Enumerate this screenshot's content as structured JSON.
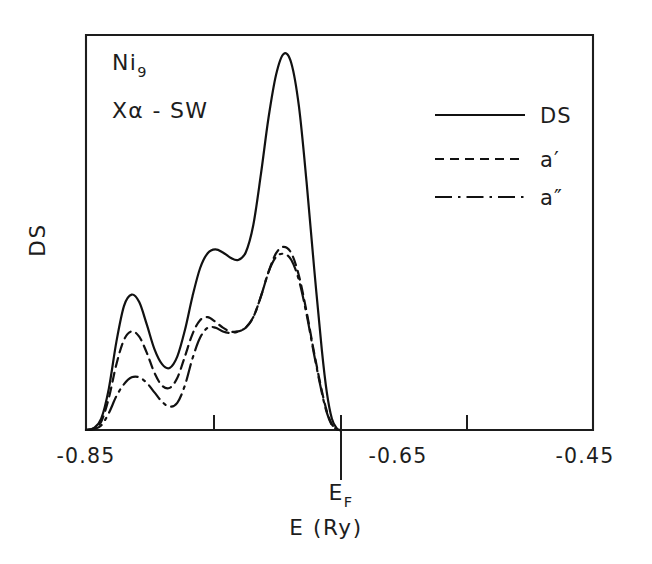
{
  "figure": {
    "annotations": {
      "system": "Ni",
      "system_subscript": "9",
      "method": "Xα - SW"
    },
    "fermi_marker": {
      "label": "E",
      "label_subscript": "F",
      "value": -0.65
    }
  },
  "legend": {
    "position": "top-right",
    "entries": [
      {
        "label": "DS",
        "style": "solid"
      },
      {
        "label": "a′",
        "style": "dashed"
      },
      {
        "label": "a″",
        "style": "dashdot"
      }
    ]
  },
  "chart_data": {
    "type": "line",
    "title": "",
    "subtitle": "",
    "xlabel": "E (Ry)",
    "ylabel": "DS",
    "xlim": [
      -0.85,
      -0.45
    ],
    "ylim": [
      0,
      1.05
    ],
    "grid": false,
    "xticks": [
      -0.85,
      -0.75,
      -0.65,
      -0.55,
      -0.45
    ],
    "xtick_labels": [
      "-0.85",
      "",
      "-0.65",
      "",
      "-0.45"
    ],
    "yticks": [],
    "ytick_labels": [],
    "annotations": [
      {
        "text": "Ni9",
        "x": -0.825,
        "y": 0.93
      },
      {
        "text": "Xα - SW",
        "x": -0.825,
        "y": 0.8
      },
      {
        "text": "EF",
        "x": -0.65,
        "y": -0.16
      }
    ],
    "series": [
      {
        "name": "DS",
        "style": "solid",
        "x": [
          -0.85,
          -0.844,
          -0.838,
          -0.832,
          -0.826,
          -0.82,
          -0.814,
          -0.808,
          -0.802,
          -0.796,
          -0.79,
          -0.784,
          -0.778,
          -0.772,
          -0.766,
          -0.76,
          -0.754,
          -0.748,
          -0.742,
          -0.736,
          -0.73,
          -0.724,
          -0.718,
          -0.712,
          -0.706,
          -0.7,
          -0.694,
          -0.688,
          -0.682,
          -0.676,
          -0.67,
          -0.664,
          -0.66,
          -0.656,
          -0.652,
          -0.65
        ],
        "y": [
          0.0,
          0.005,
          0.03,
          0.11,
          0.235,
          0.33,
          0.36,
          0.34,
          0.28,
          0.215,
          0.175,
          0.165,
          0.195,
          0.265,
          0.355,
          0.43,
          0.47,
          0.48,
          0.472,
          0.458,
          0.452,
          0.472,
          0.545,
          0.68,
          0.83,
          0.945,
          1.0,
          0.975,
          0.86,
          0.66,
          0.43,
          0.215,
          0.1,
          0.03,
          0.004,
          0.0
        ]
      },
      {
        "name": "a′",
        "style": "dashed",
        "x": [
          -0.85,
          -0.844,
          -0.838,
          -0.832,
          -0.826,
          -0.82,
          -0.814,
          -0.808,
          -0.802,
          -0.796,
          -0.79,
          -0.784,
          -0.778,
          -0.772,
          -0.766,
          -0.76,
          -0.754,
          -0.748,
          -0.742,
          -0.736,
          -0.73,
          -0.724,
          -0.718,
          -0.712,
          -0.706,
          -0.7,
          -0.694,
          -0.688,
          -0.682,
          -0.676,
          -0.67,
          -0.664,
          -0.66,
          -0.656,
          -0.652,
          -0.65
        ],
        "y": [
          0.0,
          0.004,
          0.022,
          0.085,
          0.175,
          0.24,
          0.262,
          0.248,
          0.205,
          0.152,
          0.118,
          0.112,
          0.138,
          0.195,
          0.255,
          0.292,
          0.3,
          0.288,
          0.272,
          0.262,
          0.262,
          0.272,
          0.3,
          0.355,
          0.42,
          0.47,
          0.487,
          0.47,
          0.41,
          0.315,
          0.205,
          0.105,
          0.05,
          0.015,
          0.002,
          0.0
        ]
      },
      {
        "name": "a″",
        "style": "dashdot",
        "x": [
          -0.85,
          -0.844,
          -0.838,
          -0.832,
          -0.826,
          -0.82,
          -0.814,
          -0.808,
          -0.802,
          -0.796,
          -0.79,
          -0.784,
          -0.778,
          -0.772,
          -0.766,
          -0.76,
          -0.754,
          -0.748,
          -0.742,
          -0.736,
          -0.73,
          -0.724,
          -0.718,
          -0.712,
          -0.706,
          -0.7,
          -0.694,
          -0.688,
          -0.682,
          -0.676,
          -0.67,
          -0.664,
          -0.66,
          -0.656,
          -0.652,
          -0.65
        ],
        "y": [
          0.0,
          0.002,
          0.012,
          0.045,
          0.09,
          0.122,
          0.14,
          0.14,
          0.125,
          0.1,
          0.075,
          0.062,
          0.072,
          0.118,
          0.19,
          0.245,
          0.272,
          0.272,
          0.262,
          0.258,
          0.262,
          0.272,
          0.3,
          0.355,
          0.42,
          0.46,
          0.468,
          0.452,
          0.398,
          0.308,
          0.2,
          0.1,
          0.046,
          0.013,
          0.002,
          0.0
        ]
      }
    ]
  }
}
